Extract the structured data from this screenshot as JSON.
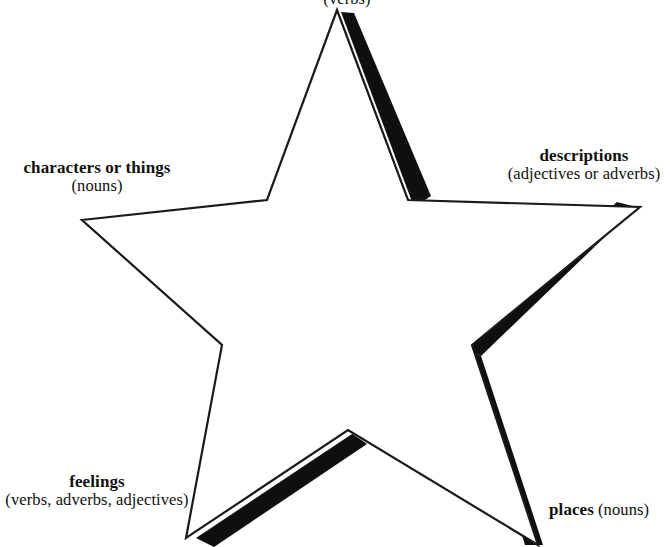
{
  "diagram": {
    "type": "story-star",
    "shape": "five-pointed-star",
    "outline_color": "#1a1a1a",
    "shadow_color": "#100f0d",
    "background_color": "#ffffff"
  },
  "labels": {
    "top": {
      "title": "",
      "sub": "(verbs)"
    },
    "left": {
      "title": "characters or things",
      "sub": "(nouns)"
    },
    "right": {
      "title": "descriptions",
      "sub": "(adjectives or adverbs)"
    },
    "bottom_left": {
      "title": "feelings",
      "sub": "(verbs, adverbs, adjectives)"
    },
    "bottom_right": {
      "title": "places",
      "sub": "(nouns)"
    }
  }
}
